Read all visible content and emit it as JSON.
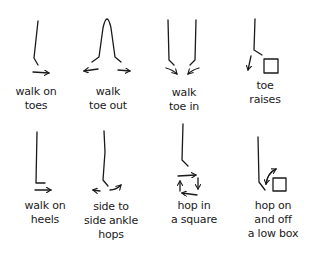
{
  "exercises": [
    {
      "id": "walk-on-toes",
      "lines": [
        "walk on",
        "toes"
      ]
    },
    {
      "id": "walk-toe-out",
      "lines": [
        "walk",
        "toe out"
      ]
    },
    {
      "id": "walk-toe-in",
      "lines": [
        "walk",
        "toe in"
      ]
    },
    {
      "id": "toe-raises",
      "lines": [
        "toe",
        "raises"
      ]
    },
    {
      "id": "walk-on-heels",
      "lines": [
        "walk on",
        "heels"
      ]
    },
    {
      "id": "side-to-side-ankle-hops",
      "lines": [
        "side to",
        "side ankle",
        "hops"
      ]
    },
    {
      "id": "hop-in-a-square",
      "lines": [
        "hop in",
        "a square"
      ]
    },
    {
      "id": "hop-on-and-off-a-low-box",
      "lines": [
        "hop on",
        "and off",
        "a low box"
      ]
    }
  ],
  "colors": {
    "ink": "#1a1a1a",
    "background": "#ffffff"
  }
}
